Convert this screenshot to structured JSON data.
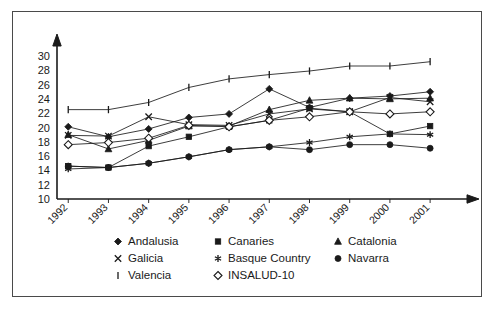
{
  "chart_data": {
    "type": "line",
    "title": "",
    "subtitle": "",
    "xlabel": "",
    "ylabel": "",
    "categories": [
      "1992",
      "1993",
      "1994",
      "1995",
      "1996",
      "1997",
      "1998",
      "1999",
      "2000",
      "2001"
    ],
    "ylim": [
      10,
      30
    ],
    "yticks": [
      10,
      12,
      14,
      16,
      18,
      20,
      22,
      24,
      26,
      28,
      30
    ],
    "ytick_labels": [
      "10",
      "12",
      "14",
      "16",
      "18",
      "20",
      "22",
      "24",
      "26",
      "28",
      "30"
    ],
    "grid": false,
    "legend_position": "bottom",
    "xtick_rotation": 45,
    "series": [
      {
        "name": "Andalusia",
        "marker": "filled-diamond",
        "values": [
          20.1,
          18.7,
          19.8,
          21.4,
          21.9,
          25.4,
          22.8,
          24.1,
          24.4,
          25.0
        ]
      },
      {
        "name": "Canaries",
        "marker": "filled-square",
        "values": [
          14.6,
          14.4,
          17.4,
          18.7,
          20.1,
          21.0,
          22.7,
          22.2,
          19.1,
          20.2
        ]
      },
      {
        "name": "Catalonia",
        "marker": "filled-triangle",
        "values": [
          19.0,
          17.0,
          18.2,
          20.2,
          20.2,
          22.5,
          23.8,
          24.1,
          24.0,
          24.1
        ]
      },
      {
        "name": "Galicia",
        "marker": "cross-x",
        "values": [
          18.9,
          18.8,
          21.5,
          20.4,
          20.3,
          21.9,
          22.6,
          22.2,
          24.2,
          23.6
        ]
      },
      {
        "name": "Basque Country",
        "marker": "asterisk",
        "values": [
          14.2,
          14.4,
          15.0,
          15.9,
          16.9,
          17.3,
          17.9,
          18.7,
          19.1,
          19.0
        ]
      },
      {
        "name": "Navarra",
        "marker": "filled-circle",
        "values": [
          14.6,
          14.4,
          15.0,
          15.9,
          16.9,
          17.3,
          16.9,
          17.6,
          17.6,
          17.1
        ]
      },
      {
        "name": "Valencia",
        "marker": "vertical-bar",
        "values": [
          22.5,
          22.5,
          23.5,
          25.6,
          26.8,
          27.4,
          27.9,
          28.6,
          28.6,
          29.2
        ]
      },
      {
        "name": "INSALUD-10",
        "marker": "open-diamond",
        "values": [
          17.6,
          17.9,
          18.5,
          20.3,
          20.1,
          21.0,
          21.5,
          22.2,
          21.9,
          22.2
        ]
      }
    ]
  },
  "legend": {
    "items": [
      {
        "label": "Andalusia",
        "marker": "filled-diamond"
      },
      {
        "label": "Canaries",
        "marker": "filled-square"
      },
      {
        "label": "Catalonia",
        "marker": "filled-triangle"
      },
      {
        "label": "Galicia",
        "marker": "cross-x"
      },
      {
        "label": "Basque Country",
        "marker": "asterisk"
      },
      {
        "label": "Navarra",
        "marker": "filled-circle"
      },
      {
        "label": "Valencia",
        "marker": "vertical-bar"
      },
      {
        "label": "INSALUD-10",
        "marker": "open-diamond"
      }
    ]
  },
  "colors": {
    "ink": "#1a1a1a",
    "background": "#ffffff",
    "frame": "#4a4a4a"
  }
}
